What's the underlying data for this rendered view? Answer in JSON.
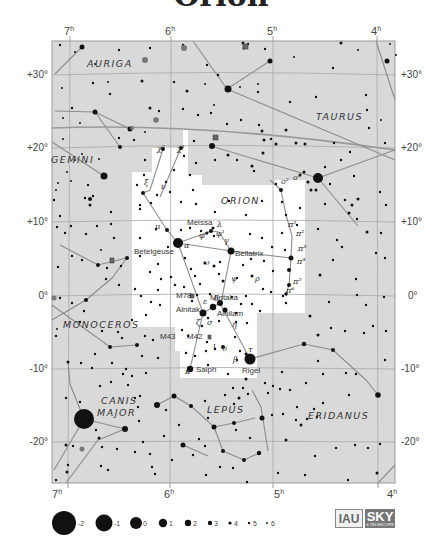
{
  "title": "Orion",
  "axes": {
    "ra_ticks": [
      {
        "label": "7",
        "sup": "h",
        "x": 70
      },
      {
        "label": "6",
        "sup": "h",
        "x": 171
      },
      {
        "label": "5",
        "sup": "h",
        "x": 273
      },
      {
        "label": "4",
        "sup": "h",
        "x": 377
      }
    ],
    "dec_ticks": [
      {
        "label": "+30°",
        "y": 75
      },
      {
        "label": "+20°",
        "y": 148
      },
      {
        "label": "+10°",
        "y": 222
      },
      {
        "label": "0°",
        "y": 296
      },
      {
        "label": "-10°",
        "y": 369
      },
      {
        "label": "-20°",
        "y": 442
      }
    ]
  },
  "constellations": [
    {
      "name": "AURIGA",
      "x": 87,
      "y": 67
    },
    {
      "name": "TAURUS",
      "x": 316,
      "y": 120
    },
    {
      "name": "GEMINI",
      "x": 51,
      "y": 163
    },
    {
      "name": "ORION",
      "x": 221,
      "y": 204
    },
    {
      "name": "MONOCEROS",
      "x": 63,
      "y": 328
    },
    {
      "name": "CANIS",
      "x": 101,
      "y": 404
    },
    {
      "name": "MAJOR",
      "x": 97,
      "y": 416
    },
    {
      "name": "LEPUS",
      "x": 207,
      "y": 413
    },
    {
      "name": "ERIDANUS",
      "x": 308,
      "y": 419
    }
  ],
  "star_labels": [
    {
      "text": "Meissa",
      "x": 187,
      "y": 225
    },
    {
      "text": "Betelgeuse",
      "x": 134,
      "y": 254
    },
    {
      "text": "Bellatrix",
      "x": 235,
      "y": 256
    },
    {
      "text": "Mintaka",
      "x": 210,
      "y": 300
    },
    {
      "text": "Alnitak",
      "x": 176,
      "y": 312
    },
    {
      "text": "Alnilam",
      "x": 217,
      "y": 316
    },
    {
      "text": "M78",
      "x": 176,
      "y": 298
    },
    {
      "text": "M43",
      "x": 160,
      "y": 339
    },
    {
      "text": "M42",
      "x": 187,
      "y": 339
    },
    {
      "text": "Saiph",
      "x": 196,
      "y": 372
    },
    {
      "text": "Rigel",
      "x": 242,
      "y": 373
    }
  ],
  "greek_labels": [
    {
      "text": "χ²",
      "x": 157,
      "y": 151
    },
    {
      "text": "χ¹",
      "x": 177,
      "y": 151
    },
    {
      "text": "ξ",
      "x": 144,
      "y": 185
    },
    {
      "text": "ν",
      "x": 161,
      "y": 189
    },
    {
      "text": "μ",
      "x": 155,
      "y": 229
    },
    {
      "text": "λ",
      "x": 217,
      "y": 227
    },
    {
      "text": "φ²",
      "x": 199,
      "y": 238
    },
    {
      "text": "φ¹",
      "x": 216,
      "y": 236
    },
    {
      "text": "α",
      "x": 184,
      "y": 248
    },
    {
      "text": "γ",
      "x": 224,
      "y": 243
    },
    {
      "text": "ω",
      "x": 203,
      "y": 265
    },
    {
      "text": "ψ",
      "x": 231,
      "y": 281
    },
    {
      "text": "ρ",
      "x": 255,
      "y": 281
    },
    {
      "text": "o²",
      "x": 281,
      "y": 184
    },
    {
      "text": "o¹",
      "x": 293,
      "y": 180
    },
    {
      "text": "π¹",
      "x": 288,
      "y": 227
    },
    {
      "text": "π²",
      "x": 296,
      "y": 236
    },
    {
      "text": "π³",
      "x": 298,
      "y": 251
    },
    {
      "text": "π⁴",
      "x": 297,
      "y": 264
    },
    {
      "text": "π⁵",
      "x": 293,
      "y": 284
    },
    {
      "text": "π⁶",
      "x": 286,
      "y": 293
    },
    {
      "text": "δ",
      "x": 214,
      "y": 301
    },
    {
      "text": "ε",
      "x": 203,
      "y": 304
    },
    {
      "text": "ζ",
      "x": 196,
      "y": 325
    },
    {
      "text": "σ",
      "x": 207,
      "y": 325
    },
    {
      "text": "η",
      "x": 232,
      "y": 327
    },
    {
      "text": "ι",
      "x": 213,
      "y": 348
    },
    {
      "text": "υ",
      "x": 222,
      "y": 351
    },
    {
      "text": "τ",
      "x": 248,
      "y": 352
    },
    {
      "text": "β",
      "x": 233,
      "y": 362
    },
    {
      "text": "κ",
      "x": 185,
      "y": 374
    }
  ],
  "legend": {
    "magnitudes": [
      "-2",
      "-1",
      "0",
      "1",
      "2",
      "3",
      "4",
      "5",
      "6"
    ]
  },
  "logos": {
    "iau": "IAU",
    "sky": "SKY",
    "sky_sub": "& TELESCOPE"
  },
  "chart_data": {
    "type": "scatter",
    "title": "Orion",
    "xlabel": "Right Ascension",
    "ylabel": "Declination",
    "x_ticks": [
      "7h",
      "6h",
      "5h",
      "4h"
    ],
    "y_ticks": [
      "+30°",
      "+20°",
      "+10°",
      "0°",
      "-10°",
      "-20°"
    ],
    "xlim": [
      "7h10m",
      "3h50m"
    ],
    "ylim": [
      -25,
      35
    ],
    "grid": true,
    "highlighted_region": "ORION",
    "neighbours": [
      "AURIGA",
      "TAURUS",
      "GEMINI",
      "MONOCEROS",
      "CANIS MAJOR",
      "LEPUS",
      "ERIDANUS"
    ],
    "named_stars": [
      "Betelgeuse",
      "Bellatrix",
      "Meissa",
      "Mintaka",
      "Alnilam",
      "Alnitak",
      "Saiph",
      "Rigel"
    ],
    "deep_sky": [
      "M42",
      "M43",
      "M78"
    ],
    "legend_magnitudes": [
      -2,
      -1,
      0,
      1,
      2,
      3,
      4,
      5,
      6
    ]
  }
}
